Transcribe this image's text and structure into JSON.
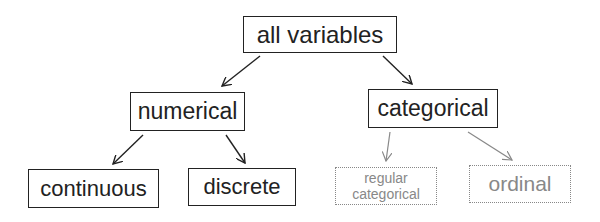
{
  "nodes": {
    "root": {
      "label": "all variables"
    },
    "numerical": {
      "label": "numerical"
    },
    "categorical": {
      "label": "categorical"
    },
    "continuous": {
      "label": "continuous"
    },
    "discrete": {
      "label": "discrete"
    },
    "regular_categorical": {
      "label_line1": "regular",
      "label_line2": "categorical"
    },
    "ordinal": {
      "label": "ordinal"
    }
  },
  "edges": [
    {
      "from": "all variables",
      "to": "numerical"
    },
    {
      "from": "all variables",
      "to": "categorical"
    },
    {
      "from": "numerical",
      "to": "continuous"
    },
    {
      "from": "numerical",
      "to": "discrete"
    },
    {
      "from": "categorical",
      "to": "regular categorical"
    },
    {
      "from": "categorical",
      "to": "ordinal"
    }
  ],
  "colors": {
    "primary": "#222222",
    "dimmed": "#888888"
  }
}
